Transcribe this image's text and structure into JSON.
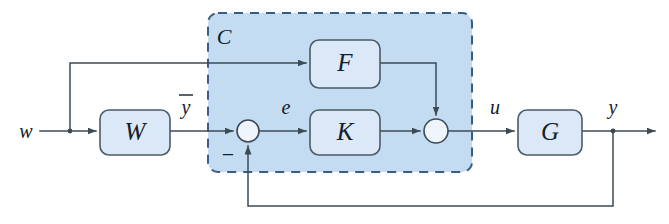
{
  "figure": {
    "type": "control-block-diagram",
    "background_color": "#ffffff"
  },
  "group": {
    "label": "C",
    "fill_color": "#c3dcf2",
    "border_color": "#3c5c86",
    "border_style": "dashed",
    "x": 208,
    "y": 13,
    "width": 264,
    "height": 159
  },
  "blocks": [
    {
      "id": "W",
      "label": "W",
      "x": 100,
      "y": 110,
      "width": 70,
      "height": 45,
      "fill": "#dbe8f7",
      "stroke": "#4a5a66"
    },
    {
      "id": "F",
      "label": "F",
      "x": 310,
      "y": 40,
      "width": 70,
      "height": 48,
      "fill": "#dbe8f7",
      "stroke": "#4a5a66"
    },
    {
      "id": "K",
      "label": "K",
      "x": 310,
      "y": 110,
      "width": 70,
      "height": 45,
      "fill": "#dbe8f7",
      "stroke": "#4a5a66"
    },
    {
      "id": "G",
      "label": "G",
      "x": 518,
      "y": 110,
      "width": 64,
      "height": 45,
      "fill": "#dbe8f7",
      "stroke": "#4a5a66"
    }
  ],
  "summing_junctions": [
    {
      "id": "sum-error",
      "cx": 248,
      "cy": 131,
      "r": 11,
      "signs": [
        "-"
      ],
      "sign_label": "−",
      "sign_x": 228,
      "sign_y": 160
    },
    {
      "id": "sum-control",
      "cx": 436,
      "cy": 131,
      "r": 12,
      "signs": [
        "+",
        "+"
      ]
    }
  ],
  "signal_labels": [
    {
      "id": "w",
      "label": "w",
      "x": 26,
      "y": 138
    },
    {
      "id": "ybar",
      "label": "y",
      "overbar": true,
      "x": 186,
      "y": 112
    },
    {
      "id": "e",
      "label": "e",
      "x": 286,
      "y": 112
    },
    {
      "id": "u",
      "label": "u",
      "x": 495,
      "y": 112
    },
    {
      "id": "y",
      "label": "y",
      "x": 613,
      "y": 112
    }
  ],
  "wires": [
    {
      "id": "w-to-W",
      "from": "w",
      "to": "W",
      "path": "M 40 131 L 100 131",
      "arrow": true
    },
    {
      "id": "w-branch-up",
      "from": "w",
      "to": "F",
      "path": "M 70 131 L 70 63 L 310 63",
      "arrow": true
    },
    {
      "id": "W-to-sum-error",
      "from": "W",
      "to": "sum-error",
      "path": "M 170 131 L 237 131",
      "arrow": true
    },
    {
      "id": "sum-error-to-K",
      "from": "sum-error",
      "to": "K",
      "path": "M 259 131 L 310 131",
      "arrow": true
    },
    {
      "id": "F-to-sum-control",
      "from": "F",
      "to": "sum-control",
      "path": "M 380 63 L 436 63 L 436 119",
      "arrow": true
    },
    {
      "id": "K-to-sum-control",
      "from": "K",
      "to": "sum-control",
      "path": "M 380 131 L 424 131",
      "arrow": true
    },
    {
      "id": "sum-control-to-G",
      "from": "sum-control",
      "to": "G",
      "path": "M 448 131 L 518 131",
      "arrow": true
    },
    {
      "id": "G-to-y",
      "from": "G",
      "to": "y",
      "path": "M 582 131 L 655 131",
      "arrow": true
    },
    {
      "id": "feedback",
      "from": "y",
      "to": "sum-error",
      "path": "M 613 131 L 613 206 L 248 206 L 248 142",
      "arrow": true
    }
  ],
  "colors": {
    "block_fill": "#dbe8f7",
    "block_stroke": "#4a5a66",
    "group_fill": "#c3dcf2",
    "group_stroke": "#3c5c86",
    "wire": "#3c4a55",
    "text": "#14202b"
  }
}
